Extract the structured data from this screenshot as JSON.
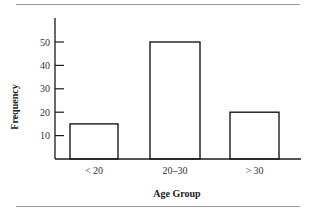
{
  "chart_data": {
    "type": "bar",
    "title": "",
    "xlabel": "Age Group",
    "ylabel": "Frequency",
    "categories": [
      "< 20",
      "20–30",
      "> 30"
    ],
    "values": [
      15,
      50,
      20
    ],
    "yticks": [
      10,
      20,
      30,
      40,
      50
    ],
    "ylim": [
      0,
      60
    ],
    "grid": false,
    "legend": null,
    "bar_fill": "#ffffff",
    "bar_stroke": "#1a1a1a"
  }
}
